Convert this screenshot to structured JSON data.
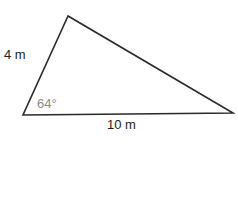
{
  "diagram": {
    "type": "triangle",
    "vertices": {
      "top": [
        68,
        16
      ],
      "bottom_left": [
        23,
        115
      ],
      "bottom_right": [
        233,
        113
      ]
    },
    "labels": {
      "left_side": "4 m",
      "bottom_side": "10 m",
      "angle_bottom_left": "64°"
    },
    "colors": {
      "stroke": "#2a2a2a",
      "text": "#222222",
      "angle_text": "#8a8a8a",
      "background": "#ffffff"
    }
  }
}
